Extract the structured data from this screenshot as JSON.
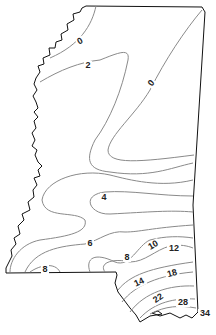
{
  "map": {
    "region": "Mississippi",
    "type": "isoline contour map",
    "contour_labels": [
      {
        "value": "0",
        "x": 80,
        "y": 44,
        "rot": -30
      },
      {
        "value": "2",
        "x": 88,
        "y": 68,
        "rot": 0
      },
      {
        "value": "0",
        "x": 151,
        "y": 86,
        "rot": -50
      },
      {
        "value": "4",
        "x": 104,
        "y": 200,
        "rot": 0
      },
      {
        "value": "6",
        "x": 90,
        "y": 246,
        "rot": 0
      },
      {
        "value": "8",
        "x": 127,
        "y": 260,
        "rot": 0
      },
      {
        "value": "10",
        "x": 153,
        "y": 248,
        "rot": -30
      },
      {
        "value": "12",
        "x": 174,
        "y": 251,
        "rot": 0
      },
      {
        "value": "8",
        "x": 45,
        "y": 272,
        "rot": 0
      },
      {
        "value": "14",
        "x": 139,
        "y": 285,
        "rot": -25
      },
      {
        "value": "18",
        "x": 172,
        "y": 276,
        "rot": -15
      },
      {
        "value": "22",
        "x": 158,
        "y": 301,
        "rot": -35
      },
      {
        "value": "28",
        "x": 183,
        "y": 305,
        "rot": 0
      },
      {
        "value": "34",
        "x": 205,
        "y": 316,
        "rot": 0
      }
    ]
  }
}
